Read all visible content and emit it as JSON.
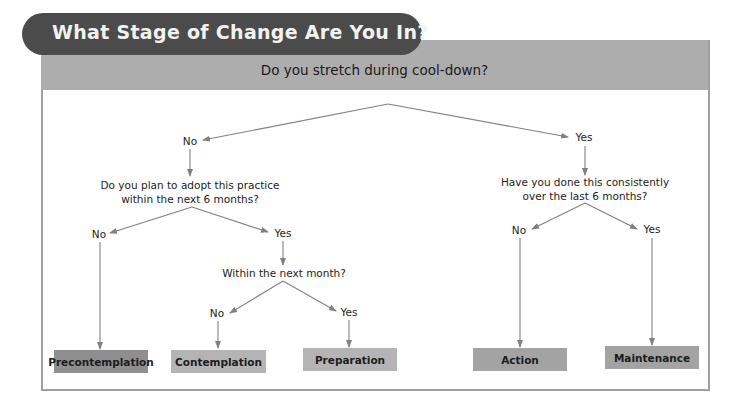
{
  "title": "What Stage of Change Are You In?",
  "root_question": "Do you stretch during cool-down?",
  "colors": {
    "title_pill": "#4b4b4b",
    "question_band": "#adadad",
    "frame_border": "#a0a0a0",
    "connector": "#808080",
    "box_precontemplation": "#8f8f8f",
    "box_contemplation": "#b4b4b4",
    "box_preparation": "#b4b4b4",
    "box_action": "#a3a3a3",
    "box_maintenance": "#a3a3a3"
  },
  "nodes": {
    "root_no": "No",
    "root_yes": "Yes",
    "q_plan_line1": "Do you plan to adopt this practice",
    "q_plan_line2": "within the next 6 months?",
    "plan_no": "No",
    "plan_yes": "Yes",
    "q_month": "Within the next month?",
    "month_no": "No",
    "month_yes": "Yes",
    "q_consistent_line1": "Have you done this consistently",
    "q_consistent_line2": "over the last 6 months?",
    "consistent_no": "No",
    "consistent_yes": "Yes"
  },
  "stages": [
    {
      "label": "Precontemplation"
    },
    {
      "label": "Contemplation"
    },
    {
      "label": "Preparation"
    },
    {
      "label": "Action"
    },
    {
      "label": "Maintenance"
    }
  ]
}
